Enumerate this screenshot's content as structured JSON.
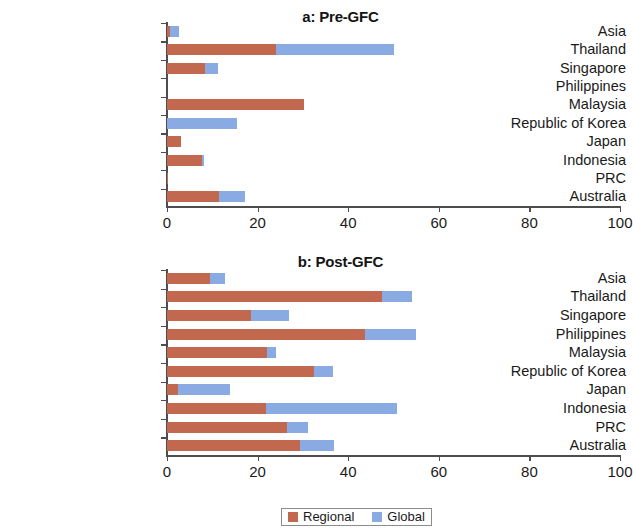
{
  "chart_data": [
    {
      "type": "bar",
      "title": "a: Pre-GFC",
      "orientation": "horizontal",
      "stacked": true,
      "xlabel": "",
      "ylabel": "",
      "xlim": [
        0,
        100
      ],
      "xticks": [
        0,
        20,
        40,
        60,
        80,
        100
      ],
      "xtick_labels": [
        "0",
        "20",
        "40",
        "60",
        "80",
        "100"
      ],
      "grid": false,
      "categories": [
        "Asia",
        "Thailand",
        "Singapore",
        "Philippines",
        "Malaysia",
        "Republic of Korea",
        "Japan",
        "Indonesia",
        "PRC",
        "Australia"
      ],
      "series": [
        {
          "name": "Regional",
          "color": "#c1684f",
          "values": [
            0.6,
            24.1,
            8.4,
            0.0,
            30.2,
            0.0,
            3.1,
            7.8,
            0.3,
            11.4
          ]
        },
        {
          "name": "Global",
          "color": "#8aaae4",
          "values": [
            2.0,
            26.0,
            2.9,
            0.0,
            0.0,
            15.5,
            0.0,
            0.3,
            0.0,
            5.9
          ]
        }
      ],
      "totals": [
        2.6,
        50.1,
        11.3,
        0.0,
        30.2,
        15.5,
        3.1,
        8.1,
        0.3,
        17.3
      ]
    },
    {
      "type": "bar",
      "title": "b: Post-GFC",
      "orientation": "horizontal",
      "stacked": true,
      "xlabel": "",
      "ylabel": "",
      "xlim": [
        0,
        100
      ],
      "xticks": [
        0,
        20,
        40,
        60,
        80,
        100
      ],
      "xtick_labels": [
        "0",
        "20",
        "40",
        "60",
        "80",
        "100"
      ],
      "grid": false,
      "categories": [
        "Asia",
        "Thailand",
        "Singapore",
        "Philippines",
        "Malaysia",
        "Republic of Korea",
        "Japan",
        "Indonesia",
        "PRC",
        "Australia"
      ],
      "series": [
        {
          "name": "Regional",
          "color": "#c1684f",
          "values": [
            9.5,
            47.5,
            18.5,
            43.7,
            22.0,
            32.5,
            2.4,
            21.9,
            26.6,
            29.4
          ]
        },
        {
          "name": "Global",
          "color": "#8aaae4",
          "values": [
            3.4,
            6.5,
            8.4,
            11.3,
            2.1,
            4.1,
            11.4,
            28.9,
            4.5,
            7.4
          ]
        }
      ],
      "totals": [
        12.9,
        54.0,
        26.9,
        55.0,
        24.1,
        36.6,
        13.8,
        50.8,
        31.1,
        36.8
      ]
    }
  ],
  "legend": {
    "position": "bottom",
    "entries": [
      {
        "label": "Regional",
        "color": "#c1684f"
      },
      {
        "label": "Global",
        "color": "#8aaae4"
      }
    ]
  }
}
